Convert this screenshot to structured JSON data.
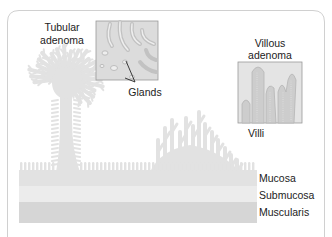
{
  "figure": {
    "title": "",
    "labels": {
      "tubular_line1": "Tubular",
      "tubular_line2": "adenoma",
      "glands": "Glands",
      "villous_line1": "Villous",
      "villous_line2": "adenoma",
      "villi": "Villi"
    },
    "layers": [
      {
        "name": "Mucosa"
      },
      {
        "name": "Submucosa"
      },
      {
        "name": "Muscularis"
      }
    ],
    "colors": {
      "tissue": "#e2e2e2",
      "tissue_dark": "#cfcfcf",
      "submucosa": "#ececec",
      "muscularis": "#d6d6d6",
      "inset_bg": "#dcdcdc",
      "inset_border": "#9a9a9a",
      "frame": "#cccccc",
      "text": "#222222",
      "pointer": "#111111"
    }
  }
}
